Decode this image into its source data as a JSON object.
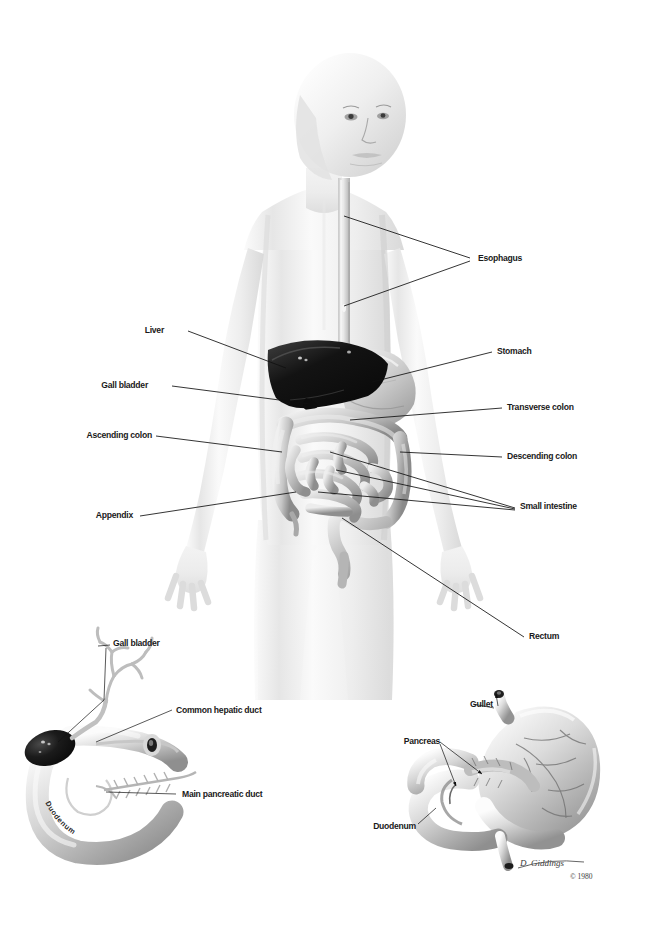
{
  "illustration": {
    "title": "Human digestive system anatomical illustration",
    "background_color": "#ffffff",
    "line_color": "#111111",
    "label_color": "#1a1a1a",
    "body_tone": "#ededed",
    "liver_color": "#1a1a1a"
  },
  "main_figure": {
    "name": "full-body-digestive-system",
    "description": "Front view of a human torso with the digestive tract shown in place",
    "labels_right": [
      {
        "text": "Esophagus",
        "x": 478,
        "y": 261
      },
      {
        "text": "Stomach",
        "x": 497,
        "y": 354
      },
      {
        "text": "Transverse colon",
        "x": 507,
        "y": 410
      },
      {
        "text": "Descending colon",
        "x": 507,
        "y": 459
      },
      {
        "text": "Small intestine",
        "x": 520,
        "y": 509
      },
      {
        "text": "Rectum",
        "x": 529,
        "y": 639
      }
    ],
    "labels_left": [
      {
        "text": "Liver",
        "x": 164,
        "y": 333
      },
      {
        "text": "Gall bladder",
        "x": 148,
        "y": 388
      },
      {
        "text": "Ascending colon",
        "x": 152,
        "y": 438
      },
      {
        "text": "Appendix",
        "x": 133,
        "y": 518
      }
    ]
  },
  "detail_gallbladder": {
    "name": "gallbladder-duodenum-detail",
    "description": "Detail drawing of gall bladder, bile ducts and duodenum",
    "labels": [
      {
        "text": "Gall bladder",
        "x": 113,
        "y": 646
      },
      {
        "text": "Common hepatic duct",
        "x": 176,
        "y": 713
      },
      {
        "text": "Main pancreatic duct",
        "x": 182,
        "y": 797
      }
    ],
    "organ_label": "Duodenum"
  },
  "detail_stomach": {
    "name": "stomach-pancreas-detail",
    "description": "Detail drawing of stomach, gullet, pancreas and duodenum",
    "labels": [
      {
        "text": "Gullet",
        "x": 470,
        "y": 707
      },
      {
        "text": "Pancreas",
        "x": 404,
        "y": 741
      },
      {
        "text": "Duodenum",
        "x": 381,
        "y": 827
      }
    ]
  },
  "credit": {
    "artist_signature": "D. Giddings",
    "copyright": "© 1980"
  }
}
